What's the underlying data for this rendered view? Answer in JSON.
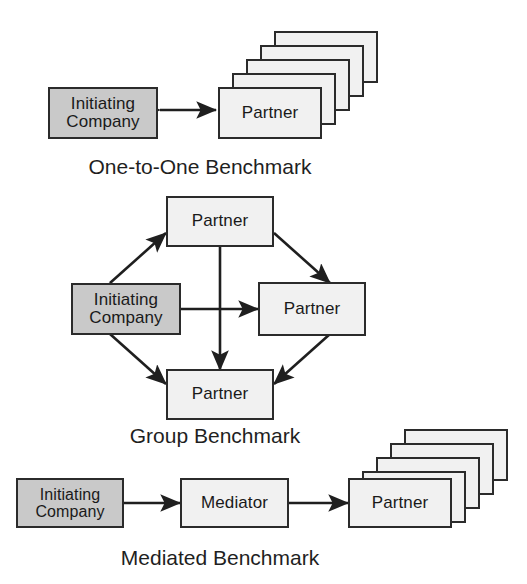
{
  "figure": {
    "background_color": "#ffffff",
    "line_color": "#2b2b2b",
    "initiator_fill": "#c9c9c9",
    "partner_fill": "#f1f1f1"
  },
  "sections": [
    {
      "id": "one-to-one",
      "caption": "One-to-One Benchmark",
      "nodes": {
        "initiator": "Initiating\nCompany",
        "partner": "Partner"
      },
      "stack_count": 5,
      "connections": [
        {
          "from": "Initiating Company",
          "to": "Partner",
          "style": "double-arrow"
        }
      ]
    },
    {
      "id": "group",
      "caption": "Group Benchmark",
      "nodes": {
        "initiator": "Initiating\nCompany",
        "partner_top": "Partner",
        "partner_right": "Partner",
        "partner_bottom": "Partner"
      },
      "stack_count": 0,
      "connections": [
        {
          "from": "Initiating Company",
          "to": "Partner (top)",
          "style": "double-arrow"
        },
        {
          "from": "Initiating Company",
          "to": "Partner (bottom)",
          "style": "double-arrow"
        },
        {
          "from": "Initiating Company",
          "to": "Partner (right)",
          "style": "double-arrow"
        },
        {
          "from": "Partner (top)",
          "to": "Partner (right)",
          "style": "double-arrow"
        },
        {
          "from": "Partner (right)",
          "to": "Partner (bottom)",
          "style": "double-arrow"
        },
        {
          "from": "Partner (top)",
          "to": "Partner (bottom)",
          "style": "double-arrow"
        }
      ]
    },
    {
      "id": "mediated",
      "caption": "Mediated Benchmark",
      "nodes": {
        "initiator": "Initiating\nCompany",
        "mediator": "Mediator",
        "partner": "Partner"
      },
      "stack_count": 5,
      "connections": [
        {
          "from": "Initiating Company",
          "to": "Mediator",
          "style": "double-arrow"
        },
        {
          "from": "Mediator",
          "to": "Partner",
          "style": "double-arrow"
        }
      ]
    }
  ]
}
